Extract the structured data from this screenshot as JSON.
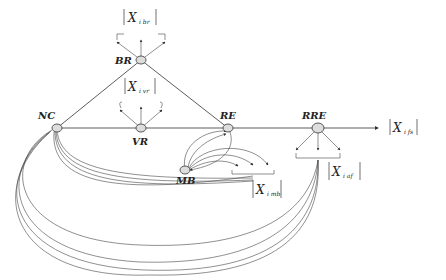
{
  "diagram": {
    "nodes": [
      {
        "id": "NC",
        "label": "NC",
        "x": 57,
        "y": 128
      },
      {
        "id": "BR",
        "label": "BR",
        "x": 141,
        "y": 60
      },
      {
        "id": "VR",
        "label": "VR",
        "x": 141,
        "y": 128
      },
      {
        "id": "RE",
        "label": "RE",
        "x": 228,
        "y": 128
      },
      {
        "id": "MB",
        "label": "MB",
        "x": 185,
        "y": 170
      },
      {
        "id": "RRE",
        "label": "RRE",
        "x": 318,
        "y": 128
      }
    ],
    "outputs": {
      "br": {
        "main": "X",
        "sub": "i br"
      },
      "vr": {
        "main": "X",
        "sub": "i vr"
      },
      "mb": {
        "main": "X",
        "sub": "i mb"
      },
      "af": {
        "main": "X",
        "sub": "i af"
      },
      "fs": {
        "main": "X",
        "sub": "i fs"
      }
    },
    "colors": {
      "stroke": "#333333",
      "node_fill": "#dddddd"
    }
  }
}
